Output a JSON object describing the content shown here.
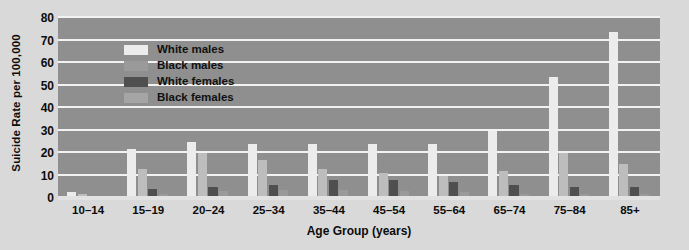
{
  "chart_data": {
    "type": "bar",
    "title": "",
    "subtitle": "",
    "xlabel": "Age Group (years)",
    "ylabel": "Suicide Rate per 100,000",
    "ylim": [
      0,
      80
    ],
    "yticks": [
      0,
      10,
      20,
      30,
      40,
      50,
      60,
      70,
      80
    ],
    "ytick_labels": [
      "0",
      "10",
      "20",
      "30",
      "40",
      "50",
      "60",
      "70",
      "80"
    ],
    "grid": "horizontal-only",
    "legend_position": "top-left-inside",
    "categories": [
      "10–14",
      "15–19",
      "20–24",
      "25–34",
      "35–44",
      "45–54",
      "55–64",
      "65–74",
      "75–84",
      "85+"
    ],
    "series": [
      {
        "name": "White males",
        "color": "#ececec",
        "values": [
          2.5,
          22,
          25,
          24,
          24,
          24,
          24,
          30,
          54,
          74
        ]
      },
      {
        "name": "Black males",
        "color": "#bdbdbd",
        "values": [
          2,
          13,
          20,
          17,
          13,
          11,
          10,
          12,
          20,
          15
        ]
      },
      {
        "name": "White females",
        "color": "#4f4f4f",
        "values": [
          0.5,
          4,
          5,
          6,
          8,
          8,
          7,
          6,
          5,
          5
        ]
      },
      {
        "name": "Black females",
        "color": "#9a9a9a",
        "values": [
          0.5,
          2,
          3,
          3.5,
          3.5,
          3,
          2.5,
          2,
          2,
          2
        ]
      }
    ]
  },
  "legend": {
    "items": [
      {
        "label": "White males",
        "swatch_class": "sw-white-males",
        "name": "legend-swatch-white-males"
      },
      {
        "label": "Black males",
        "swatch_class": "sw-black-males",
        "name": "legend-swatch-black-males"
      },
      {
        "label": "White females",
        "swatch_class": "sw-white-females",
        "name": "legend-swatch-white-females"
      },
      {
        "label": "Black females",
        "swatch_class": "sw-black-females",
        "name": "legend-swatch-black-females"
      }
    ]
  },
  "colors": {
    "page_background": "#d9d9d9",
    "plot_background": "#8f8f8f",
    "gridline": "#f2f2f2",
    "text": "#0c0c0c"
  }
}
